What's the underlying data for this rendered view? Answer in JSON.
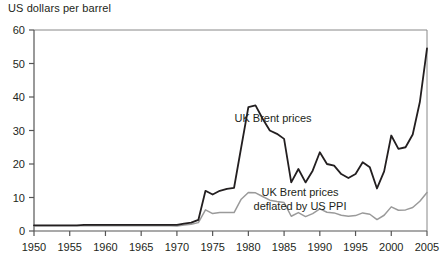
{
  "chart_data": {
    "type": "line",
    "title": "",
    "ylabel": "US dollars per barrel",
    "xlabel": "",
    "ylim": [
      0,
      60
    ],
    "xlim": [
      1950,
      2005
    ],
    "grid": false,
    "legend_position": "inline-annotations",
    "y_ticks": [
      0,
      10,
      20,
      30,
      40,
      50,
      60
    ],
    "x_ticks": [
      1950,
      1955,
      1960,
      1965,
      1970,
      1975,
      1980,
      1985,
      1990,
      1995,
      2000,
      2005
    ],
    "x": [
      1950,
      1951,
      1952,
      1953,
      1954,
      1955,
      1956,
      1957,
      1958,
      1959,
      1960,
      1961,
      1962,
      1963,
      1964,
      1965,
      1966,
      1967,
      1968,
      1969,
      1970,
      1971,
      1972,
      1973,
      1974,
      1975,
      1976,
      1977,
      1978,
      1979,
      1980,
      1981,
      1982,
      1983,
      1984,
      1985,
      1986,
      1987,
      1988,
      1989,
      1990,
      1991,
      1992,
      1993,
      1994,
      1995,
      1996,
      1997,
      1998,
      1999,
      2000,
      2001,
      2002,
      2003,
      2004,
      2005
    ],
    "series": [
      {
        "name": "UK Brent prices",
        "color": "#231f20",
        "annotation": "UK Brent prices",
        "values": [
          1.7,
          1.7,
          1.7,
          1.7,
          1.7,
          1.7,
          1.7,
          1.8,
          1.8,
          1.8,
          1.8,
          1.8,
          1.8,
          1.8,
          1.8,
          1.8,
          1.8,
          1.8,
          1.8,
          1.8,
          1.8,
          2.2,
          2.5,
          3.3,
          12.0,
          10.9,
          12.0,
          12.6,
          12.9,
          25.0,
          37.0,
          37.5,
          33.5,
          30.0,
          29.0,
          27.5,
          14.5,
          18.5,
          14.5,
          18.0,
          23.5,
          20.0,
          19.5,
          17.0,
          15.8,
          17.0,
          20.5,
          19.0,
          12.7,
          17.8,
          28.5,
          24.5,
          25.0,
          28.8,
          38.5,
          54.5
        ]
      },
      {
        "name": "UK Brent prices deflated by US PPI",
        "color": "#9a9a9a",
        "annotation": "UK Brent prices\ndeflated by US PPI",
        "values": [
          1.6,
          1.6,
          1.6,
          1.6,
          1.6,
          1.6,
          1.6,
          1.6,
          1.6,
          1.6,
          1.6,
          1.6,
          1.6,
          1.6,
          1.6,
          1.6,
          1.6,
          1.6,
          1.6,
          1.6,
          1.5,
          1.8,
          2.0,
          2.5,
          6.3,
          5.2,
          5.5,
          5.5,
          5.5,
          9.5,
          11.5,
          11.4,
          10.3,
          9.2,
          8.8,
          8.5,
          4.4,
          5.5,
          4.3,
          5.2,
          6.6,
          5.6,
          5.4,
          4.7,
          4.4,
          4.6,
          5.4,
          5.0,
          3.4,
          4.7,
          7.2,
          6.2,
          6.3,
          7.0,
          8.9,
          11.5
        ]
      }
    ],
    "annotations": [
      {
        "text": "UK Brent prices",
        "x_px": 273,
        "y_px": 122
      },
      {
        "text": "UK Brent prices",
        "x_px": 300,
        "y_px": 196
      },
      {
        "text": "deflated by US PPI",
        "x_px": 300,
        "y_px": 210
      }
    ]
  },
  "axis": {
    "y_title": "US dollars per barrel"
  }
}
